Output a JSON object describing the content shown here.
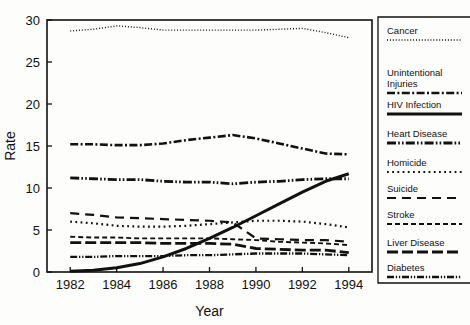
{
  "chart_data": {
    "type": "line",
    "title": "",
    "xlabel": "Year",
    "ylabel": "Rate",
    "xlim": [
      1981,
      1995
    ],
    "ylim": [
      0,
      30
    ],
    "xticks": [
      1982,
      1984,
      1986,
      1988,
      1990,
      1992,
      1994
    ],
    "yticks": [
      0,
      5,
      10,
      15,
      20,
      25,
      30
    ],
    "xtick_labels": [
      "1982",
      "1984",
      "1986",
      "1988",
      "1990",
      "1992",
      "1994"
    ],
    "ytick_labels": [
      "0",
      "5",
      "10",
      "15",
      "20",
      "25",
      "30"
    ],
    "grid": false,
    "legend_position": "right-outside",
    "x": [
      1982,
      1983,
      1984,
      1985,
      1986,
      1987,
      1988,
      1989,
      1990,
      1991,
      1992,
      1993,
      1994
    ],
    "series": [
      {
        "name": "Cancer",
        "linestyle": "dotted-fine",
        "linewidth": 1.4,
        "dash": "1,1.9",
        "values": [
          28.7,
          28.9,
          29.3,
          29.1,
          28.8,
          28.8,
          28.8,
          28.8,
          28.8,
          28.9,
          29.0,
          28.5,
          27.9
        ]
      },
      {
        "name": "Unintentional Injuries",
        "linestyle": "dash-dot",
        "linewidth": 2.6,
        "dash": "8,2.4,2,2.4",
        "values": [
          15.2,
          15.2,
          15.1,
          15.1,
          15.3,
          15.7,
          16.0,
          16.3,
          15.9,
          15.3,
          14.7,
          14.1,
          14.0
        ]
      },
      {
        "name": "HIV Infection",
        "linestyle": "solid",
        "linewidth": 3.0,
        "dash": "none",
        "values": [
          0.1,
          0.2,
          0.5,
          1.0,
          1.8,
          2.8,
          4.0,
          5.3,
          6.7,
          8.1,
          9.5,
          10.8,
          11.7
        ]
      },
      {
        "name": "Heart Disease",
        "linestyle": "dash-dot-dot",
        "linewidth": 2.8,
        "dash": "9,2.2,1.6,2.2,1.6,2.2",
        "values": [
          11.2,
          11.1,
          11.0,
          11.0,
          10.8,
          10.7,
          10.7,
          10.5,
          10.7,
          10.8,
          11.0,
          11.1,
          11.1
        ]
      },
      {
        "name": "Homicide",
        "linestyle": "dotted-coarse",
        "linewidth": 2.2,
        "dash": "1.8,3.4",
        "values": [
          6.0,
          5.8,
          5.5,
          5.4,
          5.4,
          5.5,
          5.7,
          5.9,
          6.1,
          6.1,
          6.0,
          5.7,
          5.3
        ]
      },
      {
        "name": "Suicide",
        "linestyle": "long-dash",
        "linewidth": 2.2,
        "dash": "9,6",
        "values": [
          7.0,
          6.8,
          6.5,
          6.4,
          6.3,
          6.2,
          6.1,
          5.9,
          4.0,
          3.9,
          3.8,
          3.8,
          3.6
        ]
      },
      {
        "name": "Stroke",
        "linestyle": "short-dash-thin",
        "linewidth": 1.9,
        "dash": "5,3",
        "values": [
          4.2,
          4.1,
          4.1,
          4.0,
          4.0,
          4.0,
          4.0,
          3.9,
          3.8,
          3.6,
          3.5,
          3.4,
          3.2
        ]
      },
      {
        "name": "Liver Disease",
        "linestyle": "medium-dash-thick",
        "linewidth": 2.8,
        "dash": "11,4",
        "values": [
          3.5,
          3.5,
          3.5,
          3.5,
          3.4,
          3.4,
          3.4,
          3.3,
          2.8,
          2.7,
          2.6,
          2.6,
          2.3
        ]
      },
      {
        "name": "Diabetes",
        "linestyle": "dash-dot-dot-thin",
        "linewidth": 2.3,
        "dash": "7,1.8,1.3,1.8,1.3,1.8",
        "values": [
          1.8,
          1.8,
          1.9,
          1.9,
          1.9,
          2.0,
          2.0,
          2.1,
          2.2,
          2.2,
          2.2,
          2.1,
          2.0
        ]
      }
    ]
  },
  "legend": {
    "entries": [
      {
        "label": "Cancer",
        "series": "Cancer"
      },
      {
        "label": "Unintentional",
        "label2": "Injuries",
        "series": "Unintentional Injuries"
      },
      {
        "label": "HIV Infection",
        "series": "HIV Infection"
      },
      {
        "label": "Heart Disease",
        "series": "Heart Disease"
      },
      {
        "label": "Homicide",
        "series": "Homicide"
      },
      {
        "label": "Suicide",
        "series": "Suicide"
      },
      {
        "label": "Stroke",
        "series": "Stroke"
      },
      {
        "label": "Liver Disease",
        "series": "Liver Disease"
      },
      {
        "label": "Diabetes",
        "series": "Diabetes"
      }
    ]
  },
  "colors": {
    "ink": "#111111",
    "background": "#fdfdfb"
  }
}
